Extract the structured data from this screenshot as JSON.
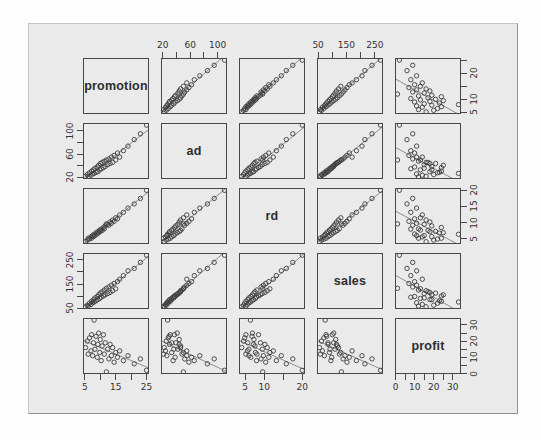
{
  "colors": {
    "page_background": "#fdfdfd",
    "figure_background": "#eaeaea",
    "figure_border": "#8f8f8f",
    "panel_border": "#474747",
    "point_stroke": "#3d3d3d",
    "fit_line": "#8d8d8d",
    "tick_text": "#333333",
    "label_text": "#2e2e2e"
  },
  "chart_data": {
    "type": "scatter",
    "subtype": "scatterplot-matrix-pairs",
    "grid": "off",
    "variables": [
      "promotion",
      "ad",
      "rd",
      "sales",
      "profit"
    ],
    "diagonal_labels": [
      "promotion",
      "ad",
      "rd",
      "sales",
      "profit"
    ],
    "point_style": "open-circle",
    "fit_line_per_panel": "linear",
    "axes": {
      "promotion": {
        "range": [
          4.4,
          25.8
        ],
        "ticks": [
          5,
          10,
          15,
          20,
          25
        ],
        "xaxis_labels": [
          5,
          15,
          25
        ],
        "yaxis_labels": [
          5,
          10,
          20
        ],
        "xaxis_side": "bottom",
        "yaxis_side": "right"
      },
      "ad": {
        "range": [
          17.4,
          113.6
        ],
        "ticks": [
          20,
          40,
          60,
          80,
          100
        ],
        "xaxis_labels": [
          20,
          60,
          100
        ],
        "yaxis_labels": [
          20,
          60,
          100
        ],
        "xaxis_side": "top",
        "yaxis_side": "left"
      },
      "rd": {
        "range": [
          3.4,
          20.7
        ],
        "ticks": [
          5,
          10,
          15,
          20
        ],
        "xaxis_labels": [
          5,
          10,
          20
        ],
        "yaxis_labels": [
          5,
          10,
          15,
          20
        ],
        "xaxis_side": "bottom",
        "yaxis_side": "right"
      },
      "sales": {
        "range": [
          46,
          279
        ],
        "ticks": [
          50,
          100,
          150,
          200,
          250
        ],
        "xaxis_labels": [
          50,
          150,
          250
        ],
        "yaxis_labels": [
          50,
          150,
          250
        ],
        "xaxis_side": "top",
        "yaxis_side": "left"
      },
      "profit": {
        "range": [
          -0.3,
          34.3
        ],
        "ticks": [
          0,
          5,
          10,
          15,
          20,
          25,
          30
        ],
        "xaxis_labels": [
          0,
          10,
          20,
          30
        ],
        "yaxis_labels": [
          0,
          10,
          20,
          30
        ],
        "xaxis_side": "bottom",
        "yaxis_side": "right"
      }
    },
    "series": {
      "promotion": [
        5.2,
        5.8,
        6.1,
        6.5,
        7,
        7.2,
        7.5,
        7.8,
        8,
        8.3,
        8.6,
        9,
        9.2,
        9.5,
        9.8,
        10,
        10.3,
        10.6,
        11,
        11.3,
        11.6,
        12,
        12.4,
        12.8,
        13.2,
        13.6,
        14,
        14.5,
        15,
        15.6,
        16.3,
        17.5,
        19,
        21,
        23,
        25
      ],
      "ad": [
        22,
        25,
        21,
        28,
        24,
        31,
        26,
        33,
        27,
        36,
        29,
        38,
        30,
        41,
        33,
        44,
        35,
        46,
        37,
        48,
        39,
        50,
        42,
        52,
        44,
        55,
        46,
        58,
        50,
        62,
        55,
        66,
        74,
        85,
        95,
        110
      ],
      "rd": [
        4.1,
        4.6,
        5.2,
        4.9,
        5.6,
        5.2,
        6,
        5.7,
        6.4,
        6,
        6.8,
        6.5,
        7.2,
        6.9,
        7.7,
        7.3,
        8,
        7.6,
        8.5,
        8.1,
        9,
        9.6,
        9.5,
        9.2,
        10.2,
        9.8,
        10.8,
        10.4,
        11.5,
        11.2,
        12.4,
        13.2,
        14.5,
        15.8,
        17.5,
        20
      ],
      "sales": [
        55,
        62,
        58,
        70,
        65,
        78,
        72,
        85,
        75,
        92,
        80,
        98,
        85,
        105,
        90,
        112,
        95,
        118,
        100,
        125,
        105,
        132,
        110,
        138,
        115,
        145,
        122,
        152,
        130,
        160,
        170,
        185,
        205,
        215,
        240,
        270
      ],
      "profit": [
        16,
        20,
        12,
        22,
        14,
        24,
        11,
        19,
        33,
        15,
        23,
        10,
        18,
        25,
        13,
        21,
        8,
        17,
        24,
        12,
        19,
        1,
        15,
        9,
        18,
        11,
        16,
        7,
        13,
        10,
        14,
        8,
        11,
        6,
        9,
        2
      ]
    }
  }
}
